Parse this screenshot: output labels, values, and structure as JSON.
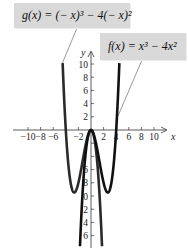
{
  "chart_data": {
    "type": "line",
    "title": "",
    "xlabel": "x",
    "ylabel": "y",
    "xlim": [
      -12,
      12
    ],
    "ylim": [
      -17.5,
      12
    ],
    "grid": false,
    "x_ticks": [
      -10,
      -8,
      -6,
      -4,
      -2,
      2,
      4,
      6,
      8,
      10
    ],
    "x_tick_labels": [
      "−10",
      "−8",
      "−6",
      "",
      "−2",
      "2",
      "4",
      "6",
      "8",
      "10"
    ],
    "y_ticks": [
      10,
      8,
      6,
      4,
      2,
      -2,
      -4,
      -6,
      -8,
      -10,
      -12,
      -14,
      -16
    ],
    "y_tick_labels": [
      "10",
      "8",
      "6",
      "4",
      "2",
      "",
      "",
      "6",
      "8",
      "0",
      "2",
      "4",
      "6"
    ],
    "series": [
      {
        "name": "g(x) = (−x)^3 − 4(−x)^2",
        "expression": "-x^3 - 4x^2",
        "x_range": [
          -4.5,
          1.75
        ],
        "color": "#2a2a2a",
        "key_points": [
          {
            "x": -4.5,
            "y": 10.1
          },
          {
            "x": -4,
            "y": 0
          },
          {
            "x": -2.67,
            "y": -9.48
          },
          {
            "x": 0,
            "y": 0
          },
          {
            "x": 1.75,
            "y": -17.6
          }
        ]
      },
      {
        "name": "f(x) = x^3 − 4x^2",
        "expression": "x^3 - 4x^2",
        "x_range": [
          -1.75,
          4.5
        ],
        "color": "#111111",
        "key_points": [
          {
            "x": -1.75,
            "y": -17.6
          },
          {
            "x": 0,
            "y": 0
          },
          {
            "x": 2.67,
            "y": -9.48
          },
          {
            "x": 4,
            "y": 0
          },
          {
            "x": 4.5,
            "y": 10.1
          }
        ]
      }
    ],
    "annotations": [
      {
        "text": "g(x) = (− x)³ − 4(− x)²",
        "target": "g"
      },
      {
        "text": "f(x) = x³ − 4x²",
        "target": "f"
      }
    ]
  },
  "labels": {
    "g": "g(x) = (− x)³ − 4(− x)²",
    "f": "f(x) = x³ − 4x²"
  },
  "axes": {
    "x_name": "x",
    "y_name": "y"
  }
}
